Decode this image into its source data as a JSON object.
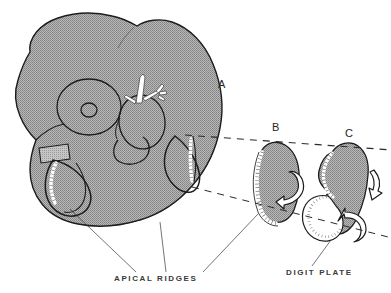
{
  "figure": {
    "background_color": "#ffffff",
    "ink_color": "#1a1a1a",
    "tissue_fill_color": "#a3a3a3",
    "ridge_color": "#ffffff",
    "label_color": "#3a3a3a"
  },
  "stages": [
    {
      "id": "a",
      "letter": "A",
      "description": "Whole embryo in lateral view with forelimb and hindlimb buds"
    },
    {
      "id": "b",
      "letter": "B",
      "description": "Enlarged limb bud with apical ectodermal ridge"
    },
    {
      "id": "c",
      "letter": "C",
      "description": "Later limb bud with digit plate"
    }
  ],
  "annotations": [
    {
      "id": "apical-ridges",
      "text": "APICAL RIDGES",
      "leader_count": 3
    },
    {
      "id": "digit-plate",
      "text": "DIGIT PLATE",
      "leader_count": 1
    }
  ],
  "structures": {
    "eye": "concentric-circles",
    "branchial_arches": "arch-outlines",
    "vascular_branch": "white-branching-vessel",
    "tail_flap": "rectangular-flap",
    "arrows": "white-outlined-curved-arrows"
  }
}
